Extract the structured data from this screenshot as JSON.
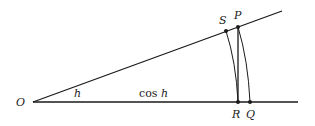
{
  "diagram": {
    "points": {
      "O": {
        "label": "O"
      },
      "S": {
        "label": "S"
      },
      "P": {
        "label": "P"
      },
      "R": {
        "label": "R"
      },
      "Q": {
        "label": "Q"
      }
    },
    "angle_label": "h",
    "segment_label_prefix": "cos ",
    "segment_label_var": "h",
    "segments": [
      {
        "from": "O",
        "to": "upper-ray-end",
        "name": "upper-ray"
      },
      {
        "from": "O",
        "to": "baseline-end",
        "name": "baseline"
      },
      {
        "from": "P",
        "to": "R",
        "name": "perpendicular-PR"
      }
    ],
    "arcs": [
      {
        "from": "S",
        "to": "R",
        "center": "O"
      },
      {
        "from": "P",
        "to": "Q",
        "center": "O"
      }
    ]
  }
}
